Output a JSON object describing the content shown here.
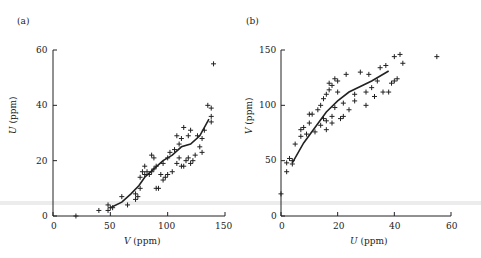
{
  "chart_data": [
    {
      "panel": "(a)",
      "type": "scatter",
      "xlabel": "V (ppm)",
      "ylabel": "U (ppm)",
      "xlim": [
        0,
        150
      ],
      "ylim": [
        0,
        60
      ],
      "xticks": [
        0,
        50,
        100,
        150
      ],
      "yticks": [
        0,
        20,
        40,
        60
      ],
      "grid": false,
      "series": [
        {
          "name": "samples",
          "marker": "+",
          "points": [
            [
              20,
              0
            ],
            [
              40,
              2
            ],
            [
              48,
              2
            ],
            [
              48,
              4
            ],
            [
              50,
              3
            ],
            [
              52,
              3
            ],
            [
              60,
              7
            ],
            [
              65,
              4
            ],
            [
              72,
              6
            ],
            [
              72,
              8
            ],
            [
              74,
              7
            ],
            [
              76,
              10
            ],
            [
              76,
              14
            ],
            [
              78,
              16
            ],
            [
              80,
              15
            ],
            [
              80,
              18
            ],
            [
              82,
              16
            ],
            [
              84,
              15
            ],
            [
              86,
              22
            ],
            [
              86,
              16
            ],
            [
              88,
              21
            ],
            [
              88,
              17
            ],
            [
              90,
              10
            ],
            [
              90,
              18
            ],
            [
              92,
              10
            ],
            [
              94,
              15
            ],
            [
              96,
              19
            ],
            [
              96,
              13
            ],
            [
              98,
              14
            ],
            [
              100,
              21
            ],
            [
              100,
              15
            ],
            [
              102,
              23
            ],
            [
              104,
              16
            ],
            [
              106,
              24
            ],
            [
              108,
              29
            ],
            [
              108,
              19
            ],
            [
              110,
              26
            ],
            [
              110,
              21
            ],
            [
              112,
              18
            ],
            [
              112,
              28
            ],
            [
              114,
              32
            ],
            [
              114,
              18
            ],
            [
              116,
              20
            ],
            [
              118,
              29
            ],
            [
              118,
              21
            ],
            [
              120,
              19
            ],
            [
              120,
              31
            ],
            [
              122,
              20
            ],
            [
              124,
              22
            ],
            [
              126,
              29
            ],
            [
              128,
              25
            ],
            [
              130,
              23
            ],
            [
              130,
              28
            ],
            [
              132,
              31
            ],
            [
              135,
              40
            ],
            [
              138,
              36
            ],
            [
              138,
              39
            ],
            [
              138,
              34
            ],
            [
              140,
              55
            ]
          ]
        },
        {
          "name": "trend",
          "type": "line",
          "points": [
            [
              50,
              3
            ],
            [
              60,
              5
            ],
            [
              68,
              8
            ],
            [
              75,
              11
            ],
            [
              80,
              14
            ],
            [
              88,
              17
            ],
            [
              96,
              20
            ],
            [
              104,
              22
            ],
            [
              112,
              25
            ],
            [
              120,
              26
            ],
            [
              128,
              29
            ],
            [
              136,
              35
            ]
          ]
        }
      ]
    },
    {
      "panel": "(b)",
      "type": "scatter",
      "xlabel": "U (ppm)",
      "ylabel": "V (ppm)",
      "xlim": [
        0,
        60
      ],
      "ylim": [
        0,
        150
      ],
      "xticks": [
        0,
        20,
        40,
        60
      ],
      "yticks": [
        0,
        50,
        100,
        150
      ],
      "grid": false,
      "series": [
        {
          "name": "samples",
          "marker": "+",
          "points": [
            [
              0,
              20
            ],
            [
              2,
              40
            ],
            [
              2,
              48
            ],
            [
              3,
              52
            ],
            [
              4,
              50
            ],
            [
              4,
              47
            ],
            [
              5,
              65
            ],
            [
              7,
              78
            ],
            [
              7,
              72
            ],
            [
              8,
              80
            ],
            [
              9,
              74
            ],
            [
              10,
              84
            ],
            [
              10,
              92
            ],
            [
              11,
              92
            ],
            [
              12,
              76
            ],
            [
              13,
              96
            ],
            [
              14,
              82
            ],
            [
              14,
              100
            ],
            [
              15,
              88
            ],
            [
              15,
              106
            ],
            [
              16,
              78
            ],
            [
              16,
              86
            ],
            [
              16,
              110
            ],
            [
              17,
              114
            ],
            [
              17,
              120
            ],
            [
              18,
              118
            ],
            [
              18,
              90
            ],
            [
              18,
              84
            ],
            [
              19,
              124
            ],
            [
              19,
              98
            ],
            [
              20,
              122
            ],
            [
              20,
              112
            ],
            [
              21,
              88
            ],
            [
              22,
              90
            ],
            [
              22,
              102
            ],
            [
              23,
              128
            ],
            [
              24,
              96
            ],
            [
              26,
              104
            ],
            [
              26,
              110
            ],
            [
              28,
              130
            ],
            [
              30,
              100
            ],
            [
              30,
              112
            ],
            [
              31,
              128
            ],
            [
              32,
              116
            ],
            [
              33,
              108
            ],
            [
              34,
              122
            ],
            [
              35,
              134
            ],
            [
              36,
              112
            ],
            [
              37,
              136
            ],
            [
              38,
              112
            ],
            [
              39,
              120
            ],
            [
              40,
              144
            ],
            [
              40,
              122
            ],
            [
              41,
              124
            ],
            [
              42,
              146
            ],
            [
              43,
              138
            ],
            [
              55,
              144
            ]
          ]
        },
        {
          "name": "trend",
          "type": "line",
          "points": [
            [
              4,
              48
            ],
            [
              8,
              66
            ],
            [
              12,
              80
            ],
            [
              16,
              94
            ],
            [
              20,
              104
            ],
            [
              24,
              112
            ],
            [
              28,
              117
            ],
            [
              32,
              122
            ],
            [
              38,
              131
            ]
          ]
        }
      ]
    }
  ],
  "labels": {
    "a": {
      "panel": "(a)",
      "y_var": "U",
      "x_var": "V",
      "unit": " (ppm)",
      "yticks": [
        "0",
        "20",
        "40",
        "60"
      ],
      "xticks": [
        "0",
        "50",
        "100",
        "150"
      ]
    },
    "b": {
      "panel": "(b)",
      "y_var": "V",
      "x_var": "U",
      "unit": " (ppm)",
      "yticks": [
        "0",
        "50",
        "100",
        "150"
      ],
      "xticks": [
        "0",
        "20",
        "40",
        "60"
      ]
    }
  },
  "colors": {
    "ink": "#222222",
    "background": "#ffffff",
    "band": "#e4e4e4"
  }
}
